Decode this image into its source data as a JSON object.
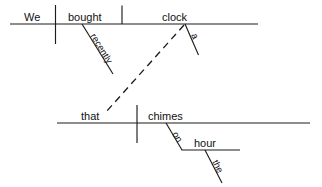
{
  "diagram": {
    "type": "reed-kellogg-sentence-diagram",
    "sentence": "We bought a clock recently that chimes on the hour",
    "ink_color": "#1c1c1c",
    "background_color": "#ffffff",
    "words": {
      "subject": "We",
      "verb": "bought",
      "direct_object": "clock",
      "adverb": "recently",
      "article_object": "a",
      "relative_pronoun": "that",
      "relative_verb": "chimes",
      "preposition": "on",
      "prep_object": "hour",
      "article_prep_object": "the"
    },
    "main_clause": {
      "baseline_label": "main-clause-baseline",
      "subject_label": "We",
      "verb_label": "bought",
      "object_label": "clock",
      "modifiers": [
        {
          "word": "recently",
          "attaches_to": "bought",
          "kind": "adverb"
        },
        {
          "word": "a",
          "attaches_to": "clock",
          "kind": "article"
        }
      ]
    },
    "relative_clause": {
      "baseline_label": "relative-clause-baseline",
      "subject_label": "that",
      "verb_label": "chimes",
      "prepositional_phrase": {
        "preposition": "on",
        "object": "hour",
        "object_modifier": "the"
      }
    },
    "connector": {
      "kind": "dashed",
      "from": "clock",
      "to": "that",
      "meaning": "relative-pronoun-reference"
    }
  }
}
